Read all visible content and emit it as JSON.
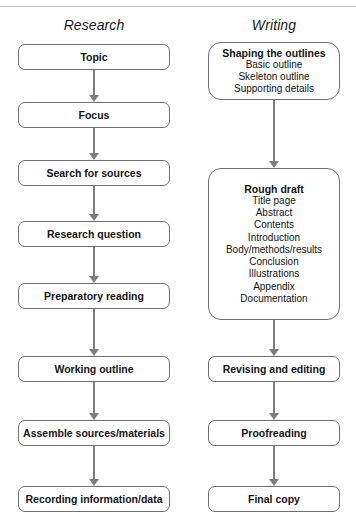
{
  "figure": {
    "type": "flowchart",
    "orientation": "two parallel vertical columns with downward arrows",
    "background_color": "#ffffff",
    "box_border_color": "#6d6f72",
    "arrow_color": "#7b7d80",
    "text_color": "#141414"
  },
  "columns": [
    {
      "id": "research",
      "header": "Research",
      "nodes": [
        {
          "label": "Topic",
          "sub": []
        },
        {
          "label": "Focus",
          "sub": []
        },
        {
          "label": "Search for sources",
          "sub": []
        },
        {
          "label": "Research question",
          "sub": []
        },
        {
          "label": "Preparatory reading",
          "sub": []
        },
        {
          "label": "Working outline",
          "sub": []
        },
        {
          "label": "Assemble sources/materials",
          "sub": []
        },
        {
          "label": "Recording information/data",
          "sub": []
        }
      ]
    },
    {
      "id": "writing",
      "header": "Writing",
      "nodes": [
        {
          "label": "Shaping the outlines",
          "sub": [
            "Basic outline",
            "Skeleton outline",
            "Supporting details"
          ]
        },
        {
          "label": "Rough draft",
          "sub": [
            "Title page",
            "Abstract",
            "Contents",
            "Introduction",
            "Body/methods/results",
            "Conclusion",
            "Illustrations",
            "Appendix",
            "Documentation"
          ]
        },
        {
          "label": "Revising and editing",
          "sub": []
        },
        {
          "label": "Proofreading",
          "sub": []
        },
        {
          "label": "Final copy",
          "sub": []
        }
      ]
    }
  ],
  "connectors": {
    "research": [
      {
        "from": "Topic",
        "to": "Focus"
      },
      {
        "from": "Focus",
        "to": "Search for sources"
      },
      {
        "from": "Search for sources",
        "to": "Research question"
      },
      {
        "from": "Research question",
        "to": "Preparatory reading"
      },
      {
        "from": "Preparatory reading",
        "to": "Working outline"
      },
      {
        "from": "Working outline",
        "to": "Assemble sources/materials"
      },
      {
        "from": "Assemble sources/materials",
        "to": "Recording information/data"
      }
    ],
    "writing": [
      {
        "from": "Shaping the outlines",
        "to": "Rough draft"
      },
      {
        "from": "Rough draft",
        "to": "Revising and editing"
      },
      {
        "from": "Revising and editing",
        "to": "Proofreading"
      },
      {
        "from": "Proofreading",
        "to": "Final copy"
      }
    ]
  }
}
